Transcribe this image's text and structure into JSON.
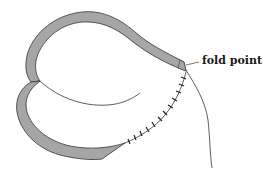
{
  "diagram": {
    "labels": {
      "fold_point": "fold point"
    },
    "colors": {
      "band_fill": "#a6a6a6",
      "stroke": "#333333",
      "background": "#ffffff"
    },
    "elements": [
      "upper-lobe-band",
      "lower-lobe-band",
      "inner-curve",
      "stitched-seam",
      "hanging-line",
      "fold-point-leader"
    ],
    "stitch_count": 12
  }
}
